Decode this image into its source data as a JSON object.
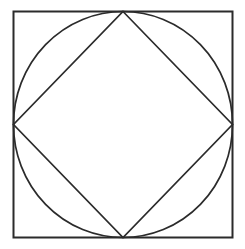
{
  "canvas": {
    "width": 245,
    "height": 249,
    "background_color": "#ffffff",
    "title": "Square with inscribed circle and inscribed rotated square"
  },
  "figure": {
    "stroke_color": "#2b2b2b",
    "fill_color": "none",
    "shapes": [
      {
        "id": "outer-square",
        "type": "rect",
        "label": "Outer square",
        "x": 13.5,
        "y": 11.5,
        "width": 219,
        "height": 226,
        "stroke_color": "#2b2b2b",
        "stroke_width": 2,
        "fill": "none"
      },
      {
        "id": "inscribed-circle",
        "type": "ellipse",
        "label": "Inscribed circle",
        "cx": 123,
        "cy": 124.5,
        "rx": 109.5,
        "ry": 113,
        "stroke_color": "#2b2b2b",
        "stroke_width": 1.7,
        "fill": "none"
      },
      {
        "id": "inscribed-diamond",
        "type": "polygon",
        "label": "Inscribed rotated square (diamond)",
        "points": "123,11.5 232.5,124.5 123,237.5 13.5,124.5",
        "vertices": [
          {
            "name": "top-vertex",
            "x": 123,
            "y": 11.5
          },
          {
            "name": "right-vertex",
            "x": 232.5,
            "y": 124.5
          },
          {
            "name": "bottom-vertex",
            "x": 123,
            "y": 237.5
          },
          {
            "name": "left-vertex",
            "x": 13.5,
            "y": 124.5
          }
        ],
        "stroke_color": "#2b2b2b",
        "stroke_width": 1.7,
        "fill": "none"
      }
    ]
  }
}
